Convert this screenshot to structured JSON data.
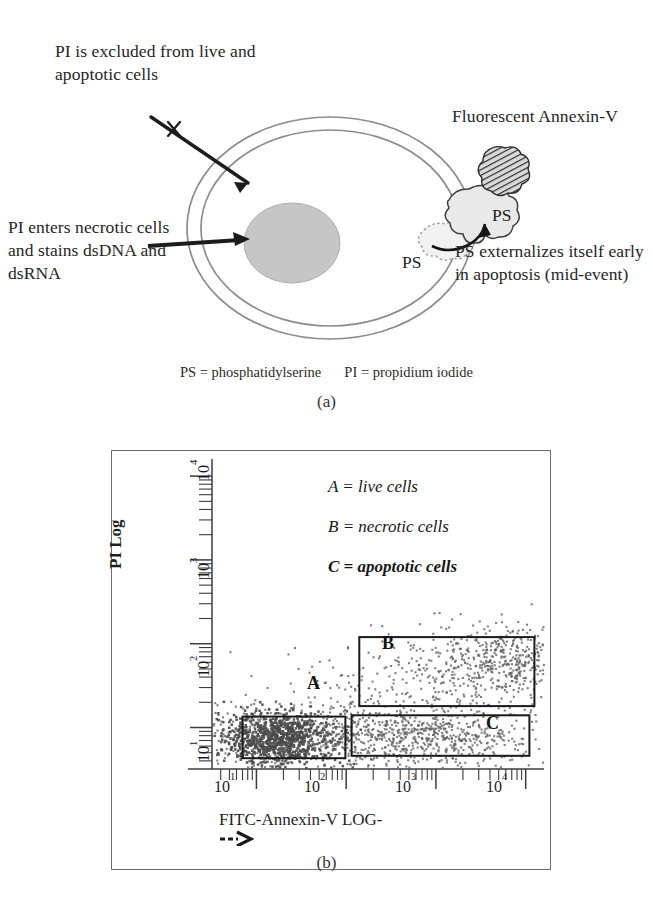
{
  "panel_a": {
    "sublabel": "(a)",
    "annotations": {
      "pi_excluded": "PI is excluded from live and apoptotic cells",
      "pi_enters": "PI enters necrotic cells and stains dsDNA and dsRNA",
      "fluorescent_annexin": "Fluorescent Annexin-V",
      "ps_externalizes": "PS externalizes itself early in apoptosis (mid-event)"
    },
    "ps_label_outer": "PS",
    "ps_label_inner": "PS",
    "definitions": {
      "ps": "PS = phosphatidylserine",
      "pi": "PI = propidium iodide"
    },
    "colors": {
      "membrane_stroke": "#8a8a8a",
      "nucleus_fill": "#c4c4c4",
      "ps_blob_fill": "#e8e8e8",
      "annexin_fill": "#4a4a4a",
      "arrow": "#1a1a1a"
    }
  },
  "panel_b": {
    "sublabel": "(b)",
    "legend": [
      {
        "text": "A = live cells",
        "bold": false
      },
      {
        "text": "B = necrotic cells",
        "bold": false
      },
      {
        "text": "C = apoptotic cells",
        "bold": true
      }
    ],
    "gate_labels": {
      "a": "A",
      "b": "B",
      "c": "C"
    },
    "colors": {
      "frame": "#6e6e6e",
      "axis": "#3b3b3b",
      "gate_box": "#1a1a1a",
      "dots": "#5d5d5d",
      "dots_dense": "#4a4a4a"
    },
    "chart_data": {
      "type": "scatter",
      "title": "",
      "xlabel": "FITC-Annexin-V LOG-->",
      "ylabel": "PI Log",
      "xscale": "log",
      "yscale": "log",
      "xlim": [
        3.2,
        16000
      ],
      "ylim": [
        3.2,
        16000
      ],
      "xticks": [
        10,
        100,
        1000,
        10000
      ],
      "xticklabels": [
        "10¹",
        "10²",
        "10³",
        "10⁴"
      ],
      "yticks": [
        100,
        1000,
        10000
      ],
      "yticklabels": [
        "10²",
        "10³",
        "10⁴"
      ],
      "grid": false,
      "legend_position": "upper-right-inside",
      "minor_ticks": true,
      "gates": [
        {
          "name": "A",
          "description": "live cells",
          "x_range": [
            7.0,
            98.0
          ],
          "y_range": [
            4.3,
            13.5
          ],
          "label_pos": [
            42.0,
            42.0
          ],
          "point_count": 1150,
          "density": "very-high"
        },
        {
          "name": "B",
          "description": "necrotic cells",
          "x_range": [
            140.0,
            12500.0
          ],
          "y_range": [
            18.0,
            120.0
          ],
          "label_pos": [
            330.0,
            75.0
          ],
          "point_count": 430,
          "density": "medium"
        },
        {
          "name": "C",
          "description": "apoptotic cells",
          "x_range": [
            115.0,
            11000.0
          ],
          "y_range": [
            4.6,
            14.0
          ],
          "label_pos": [
            4200.0,
            8.2
          ],
          "point_count": 720,
          "density": "high"
        }
      ],
      "clusters": [
        {
          "name": "live-core",
          "cx": 18,
          "cy": 7.2,
          "n": 900,
          "spread_x": 0.3,
          "spread_y": 0.16
        },
        {
          "name": "live-halo",
          "cx": 11,
          "cy": 7.0,
          "n": 260,
          "spread_x": 0.38,
          "spread_y": 0.24
        },
        {
          "name": "apoptotic-band",
          "cx": 700,
          "cy": 7.6,
          "n": 640,
          "spread_x": 0.62,
          "spread_y": 0.17
        },
        {
          "name": "necrotic-band",
          "cx": 3000,
          "cy": 52,
          "n": 420,
          "spread_x": 0.58,
          "spread_y": 0.26
        },
        {
          "name": "necrotic-hot",
          "cx": 8000,
          "cy": 62,
          "n": 190,
          "spread_x": 0.28,
          "spread_y": 0.2
        },
        {
          "name": "transition",
          "cx": 130,
          "cy": 14,
          "n": 120,
          "spread_x": 0.3,
          "spread_y": 0.34
        },
        {
          "name": "scatter-noise",
          "cx": 300,
          "cy": 9,
          "n": 110,
          "spread_x": 0.95,
          "spread_y": 0.45
        }
      ]
    }
  }
}
